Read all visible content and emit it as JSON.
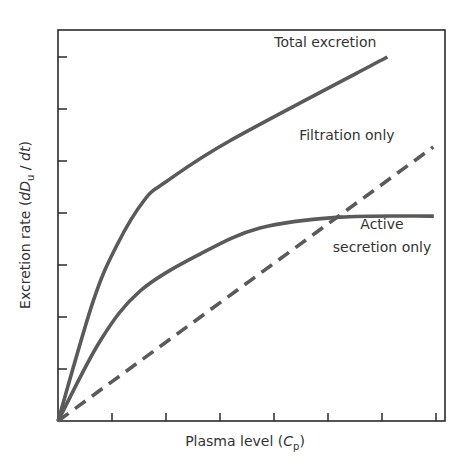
{
  "chart_data": {
    "type": "line",
    "title": "",
    "xlabel": "Plasma level (Cp)",
    "ylabel": "Excretion rate (dDu/dt)",
    "xlabel_parts": {
      "main": "Plasma level (",
      "var": "C",
      "sub": "p",
      "close": ")"
    },
    "ylabel_parts": {
      "main": "Excretion rate (",
      "var": "dD",
      "sub": "u",
      "slash": " / ",
      "var2": "dt",
      "close": ")"
    },
    "xlim": [
      0,
      7.2
    ],
    "ylim": [
      0,
      7.5
    ],
    "x_ticks": [
      1,
      2,
      3,
      4,
      5,
      6,
      7
    ],
    "y_ticks": [
      1,
      2,
      3,
      4,
      5,
      6,
      7
    ],
    "tick_labels_shown": false,
    "grid": false,
    "legend": "inline annotations",
    "series": [
      {
        "name": "Total excretion",
        "style": "solid",
        "x": [
          0,
          0.65,
          1.1,
          1.6,
          2.0,
          3.2,
          6.1
        ],
        "y": [
          0,
          2.3,
          3.4,
          4.25,
          4.6,
          5.4,
          7.0
        ]
      },
      {
        "name": "Filtration only",
        "style": "dashed",
        "x": [
          0,
          6.95
        ],
        "y": [
          0,
          5.27
        ]
      },
      {
        "name": "Active secretion only",
        "style": "solid",
        "x": [
          0,
          0.78,
          1.52,
          2.63,
          3.74,
          5.22,
          6.96
        ],
        "y": [
          0,
          1.54,
          2.5,
          3.21,
          3.71,
          3.92,
          3.94
        ]
      }
    ],
    "annotations": [
      {
        "text": "Total excretion",
        "x": 4.95,
        "y": 7.2
      },
      {
        "text": "Filtration only",
        "x": 5.35,
        "y": 5.4
      },
      {
        "text": "Active",
        "x": 6.0,
        "y": 3.7
      },
      {
        "text": "secretion only",
        "x": 6.0,
        "y": 3.25
      }
    ],
    "line_color": "#5a5a5a",
    "axis_color": "#2a2a2a"
  }
}
